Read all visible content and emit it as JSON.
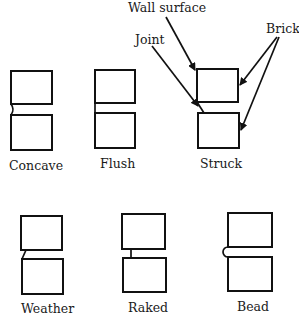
{
  "callouts": {
    "wall_surface": "Wall surface",
    "joint": "Joint",
    "brick": "Brick"
  },
  "joints": [
    {
      "id": "concave",
      "label": "Concave"
    },
    {
      "id": "flush",
      "label": "Flush"
    },
    {
      "id": "struck",
      "label": "Struck"
    },
    {
      "id": "weather",
      "label": "Weather"
    },
    {
      "id": "raked",
      "label": "Raked"
    },
    {
      "id": "bead",
      "label": "Bead"
    }
  ]
}
